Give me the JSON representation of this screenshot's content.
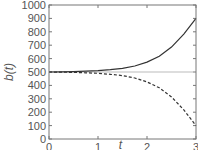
{
  "chart_data": {
    "type": "line",
    "title": "",
    "xlabel": "t",
    "ylabel": "b(t)",
    "xlim": [
      0,
      3
    ],
    "ylim": [
      0,
      1000
    ],
    "xticks": [
      0,
      1,
      2,
      3
    ],
    "xtick_labels": [
      "0",
      "1",
      "2",
      "3"
    ],
    "yticks": [
      0,
      100,
      200,
      300,
      400,
      500,
      600,
      700,
      800,
      900,
      1000
    ],
    "ytick_labels": [
      "0",
      "100",
      "200",
      "300",
      "400",
      "500",
      "600",
      "700",
      "800",
      "900",
      "1000"
    ],
    "grid": false,
    "reference_line": {
      "y": 500,
      "color": "#bbbbbb"
    },
    "x": [
      0,
      0.25,
      0.5,
      0.75,
      1.0,
      1.25,
      1.5,
      1.75,
      2.0,
      2.25,
      2.5,
      2.75,
      3.0
    ],
    "series": [
      {
        "name": "upper",
        "style": "solid",
        "color": "#333333",
        "values": [
          500,
          501,
          503,
          506,
          510,
          517,
          527,
          545,
          574,
          618,
          686,
          783,
          900
        ]
      },
      {
        "name": "lower",
        "style": "dashed",
        "color": "#333333",
        "values": [
          500,
          499,
          497,
          494,
          490,
          483,
          473,
          455,
          426,
          382,
          314,
          217,
          100
        ]
      }
    ],
    "legend": null
  }
}
